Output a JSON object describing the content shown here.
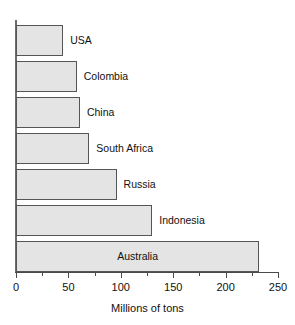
{
  "chart_data": {
    "type": "bar",
    "orientation": "horizontal",
    "title": "",
    "subtitle": "",
    "xlabel": "Millions of tons",
    "ylabel": "",
    "categories": [
      "USA",
      "Colombia",
      "China",
      "South Africa",
      "Russia",
      "Indonesia",
      "Australia"
    ],
    "values": [
      45,
      58,
      61,
      70,
      96,
      130,
      232
    ],
    "xlim": [
      0,
      250
    ],
    "ylim": null,
    "x_major_ticks": [
      0,
      50,
      100,
      150,
      200,
      250
    ],
    "x_minor_ticks": [
      25,
      75,
      125,
      175,
      225
    ],
    "x_tick_labels": [
      "0",
      "50",
      "100",
      "150",
      "200",
      "250"
    ],
    "grid": false,
    "legend": null,
    "legend_position": "none",
    "annotations": [],
    "bar_label_placement": [
      "outside",
      "outside",
      "outside",
      "outside",
      "outside",
      "outside",
      "inside"
    ],
    "colors": {
      "bar_fill": "#e4e4e4",
      "bar_stroke": "#555555",
      "axis": "#4a4a4a",
      "text": "#111111",
      "background": "#ffffff"
    }
  },
  "axis": {
    "x_title": "Millions of tons"
  }
}
